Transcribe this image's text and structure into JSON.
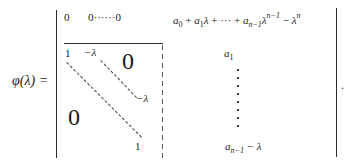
{
  "formula": {
    "lhs": "φ(λ) =",
    "top_row": {
      "first": "0",
      "rest": "0······0"
    },
    "block": {
      "top_left_one": "1",
      "top_neg_lambda": "−λ",
      "upper_zero": "0",
      "right_neg_lambda": "−λ",
      "lower_zero": "0",
      "bottom_one": "1"
    },
    "last_column": {
      "top_entry": {
        "a": "a",
        "s0": "0",
        "plus1": " + ",
        "a1": "a",
        "s1": "1",
        "lam1": "λ",
        "mid": " + ··· + ",
        "an": "a",
        "sn": "n−1",
        "lam2": "λ",
        "p1": "n−1",
        "minus": " − ",
        "lam3": "λ",
        "p2": "n"
      },
      "second_entry": {
        "a": "a",
        "s": "1"
      },
      "last_entry": {
        "a": "a",
        "s": "n−1",
        "rest": " − λ"
      }
    },
    "terminator": "."
  }
}
